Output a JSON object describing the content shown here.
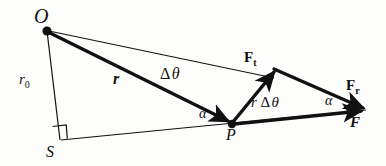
{
  "figure": {
    "type": "vector-force-diagram",
    "background_color": "#fdfdfc",
    "ink_color": "#111111",
    "width": 386,
    "height": 166,
    "points": {
      "origin_label": "O",
      "origin_x": 47,
      "origin_y": 31,
      "surface_label": "S",
      "surface_x": 60,
      "surface_y": 143,
      "particle_label": "P",
      "particle_x": 232,
      "particle_y": 124,
      "force_apex_x": 272,
      "force_apex_y": 68,
      "force_tip_x": 365,
      "force_tip_y": 110
    },
    "labels": {
      "r_zero": "r",
      "r_zero_sub": "0",
      "r_vector": "r",
      "delta_theta_delta": "Δ",
      "delta_theta_theta": "θ",
      "r_delta_theta_r": "r",
      "r_delta_theta_delta": "Δ",
      "r_delta_theta_theta": "θ",
      "force_tangential": "F",
      "force_tangential_sub": "t",
      "force_radial": "F",
      "force_radial_sub": "r",
      "force_resultant": "F",
      "alpha_at_p": "α",
      "alpha_at_fr": "α",
      "right_angle": "∟"
    }
  }
}
